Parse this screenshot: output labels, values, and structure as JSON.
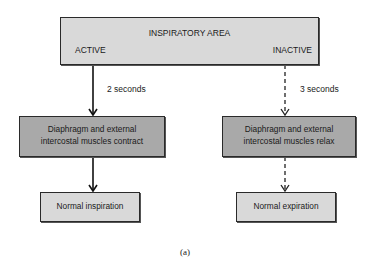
{
  "diagram": {
    "top_box": {
      "title": "INSPIRATORY AREA",
      "left_state": "ACTIVE",
      "right_state": "INACTIVE"
    },
    "left_branch": {
      "duration_label": "2 seconds",
      "muscle_box_line1": "Diaphragm and external",
      "muscle_box_line2": "intercostal muscles contract",
      "result_box": "Normal inspiration",
      "arrow_style": "solid"
    },
    "right_branch": {
      "duration_label": "3 seconds",
      "muscle_box_line1": "Diaphragm and external",
      "muscle_box_line2": "intercostal muscles relax",
      "result_box": "Normal expiration",
      "arrow_style": "dashed"
    },
    "caption": "(a)",
    "colors": {
      "light_box": "#d9d9d9",
      "dark_box": "#a9a9a9",
      "border": "#2a2a2a"
    }
  }
}
